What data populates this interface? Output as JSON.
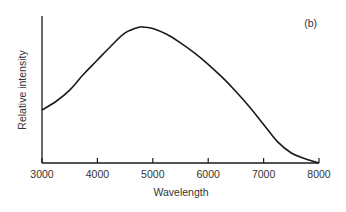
{
  "chart_data": {
    "type": "line",
    "title": "",
    "panel_label": "(b)",
    "xlabel": "Wavelength",
    "ylabel": "Relative intensity",
    "xlim": [
      3000,
      8000
    ],
    "ylim": [
      0,
      1
    ],
    "x_ticks": [
      3000,
      4000,
      5000,
      6000,
      7000,
      8000
    ],
    "y_ticks": [],
    "grid": false,
    "legend": null,
    "series": [
      {
        "name": "Relative intensity",
        "x": [
          3000,
          3250,
          3500,
          3750,
          4000,
          4250,
          4500,
          4750,
          4850,
          5000,
          5250,
          5500,
          5750,
          6000,
          6250,
          6500,
          6750,
          7000,
          7250,
          7500,
          7750,
          8000
        ],
        "values": [
          0.37,
          0.43,
          0.51,
          0.62,
          0.72,
          0.82,
          0.91,
          0.95,
          0.95,
          0.94,
          0.9,
          0.84,
          0.77,
          0.69,
          0.6,
          0.5,
          0.39,
          0.27,
          0.15,
          0.07,
          0.03,
          0.0
        ]
      }
    ]
  }
}
